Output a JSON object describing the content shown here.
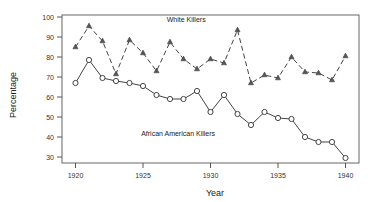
{
  "chart_data": {
    "type": "line",
    "title": "",
    "xlabel": "Year",
    "ylabel": "Percentage",
    "xlim": [
      1919,
      1941
    ],
    "ylim": [
      27,
      101
    ],
    "xticks": [
      1920,
      1925,
      1930,
      1935,
      1940
    ],
    "yticks": [
      30,
      40,
      50,
      60,
      70,
      80,
      90,
      100
    ],
    "grid": false,
    "legend_position": "inline-annotations",
    "x": [
      1920,
      1921,
      1922,
      1923,
      1924,
      1925,
      1926,
      1927,
      1928,
      1929,
      1930,
      1931,
      1932,
      1933,
      1934,
      1935,
      1936,
      1937,
      1938,
      1939,
      1940
    ],
    "series": [
      {
        "name": "White Killers",
        "marker": "triangle",
        "linestyle": "dashed",
        "values": [
          85.0,
          95.5,
          88.0,
          71.5,
          88.5,
          82.0,
          73.0,
          87.5,
          79.0,
          74.0,
          79.0,
          77.0,
          93.5,
          67.0,
          71.0,
          69.5,
          80.0,
          72.5,
          72.0,
          68.5,
          80.5
        ]
      },
      {
        "name": "African American Killers",
        "marker": "circle",
        "linestyle": "solid",
        "values": [
          67.0,
          78.5,
          69.5,
          68.0,
          67.0,
          65.5,
          61.0,
          59.0,
          59.0,
          63.0,
          52.5,
          61.0,
          51.5,
          46.0,
          52.5,
          49.5,
          49.0,
          40.0,
          37.5,
          37.5,
          29.5
        ]
      }
    ],
    "annotations": [
      {
        "text": "White Killers",
        "x": 1928.2,
        "y": 97.5
      },
      {
        "text": "African American Killers",
        "x": 1927.6,
        "y": 40.5
      }
    ]
  },
  "axis": {
    "x_tick_labels": [
      "1920",
      "1925",
      "1930",
      "1935",
      "1940"
    ],
    "y_tick_labels": [
      "30",
      "40",
      "50",
      "60",
      "70",
      "80",
      "90",
      "100"
    ],
    "x_title": "Year",
    "y_title": "Percentage"
  },
  "colors": {
    "line": "#444444",
    "axis": "#555555",
    "frame": "#666666",
    "text": "#222222",
    "background": "#ffffff"
  }
}
